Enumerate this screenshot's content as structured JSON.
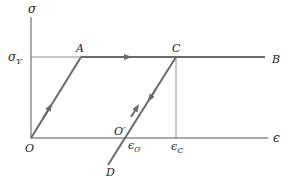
{
  "diagram": {
    "axes": {
      "y_label": "σ",
      "x_label": "ϵ"
    },
    "labels": {
      "sigma_y": "σ",
      "sigma_y_sub": "Y",
      "point_A": "A",
      "point_B": "B",
      "point_C": "C",
      "point_D": "D",
      "point_O": "O",
      "point_O_prime": "O′",
      "eps_O_prime": "ϵ",
      "eps_O_prime_sub": "O′",
      "eps_C": "ϵ",
      "eps_C_sub": "C"
    },
    "colors": {
      "axis": "#555555",
      "path": "#6a6a6a",
      "text": "#222222",
      "background": "#ffffff"
    },
    "points": {
      "O": [
        31,
        138
      ],
      "A": [
        81,
        57
      ],
      "C": [
        176,
        57
      ],
      "B": [
        265,
        57
      ],
      "O_prime": [
        126,
        138
      ],
      "D": [
        108,
        165
      ]
    }
  }
}
